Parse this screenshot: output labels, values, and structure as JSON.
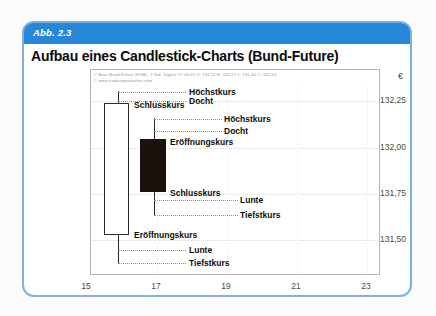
{
  "figure": {
    "label": "Abb. 2.3",
    "title": "Aufbau eines Candlestick-Charts (Bund-Future)"
  },
  "fine_print": {
    "line1": "© Euro-Bund-Future (FGBL, 1 Std. Tages) 17.06.05  O: 131,52  H: 132,27  L: 131,44  C: 132,24",
    "line2": "© www.tradesignalonline.com"
  },
  "axes": {
    "currency": "€",
    "y_labels": [
      "132,25",
      "132,00",
      "131,75",
      "131,50"
    ],
    "x_labels": [
      "15",
      "17",
      "19",
      "21",
      "23"
    ]
  },
  "annotations": {
    "candle1": {
      "high": "Höchstkurs",
      "upper_wick": "Docht",
      "close": "Schlusskurs",
      "open": "Eröffnungskurs",
      "lower_wick": "Lunte",
      "low": "Tiefstkurs"
    },
    "candle2": {
      "high": "Höchstkurs",
      "upper_wick": "Docht",
      "open": "Eröffnungskurs",
      "close": "Schlusskurs",
      "lower_wick": "Lunte",
      "low": "Tiefstkurs"
    }
  },
  "colors": {
    "header_blue": "#2787d9",
    "card_border": "#7db1e2",
    "candle_black_body": "#1c120d",
    "candle_white_body": "#ffffff"
  },
  "chart_data": {
    "type": "candlestick",
    "title": "Aufbau eines Candlestick-Charts (Bund-Future)",
    "ylabel": "€",
    "x_ticks": [
      15,
      17,
      19,
      21,
      23
    ],
    "y_ticks": [
      132.25,
      132.0,
      131.75,
      131.5
    ],
    "ylim": [
      131.35,
      132.42
    ],
    "xlim": [
      14.9,
      23.4
    ],
    "grid": true,
    "legend": false,
    "series": [
      {
        "name": "bullish-white-candle",
        "x": 16,
        "open": 131.53,
        "high": 132.3,
        "low": 131.37,
        "close": 132.24,
        "body": "white"
      },
      {
        "name": "bearish-black-candle",
        "x": 17,
        "open": 132.04,
        "high": 132.16,
        "low": 131.63,
        "close": 131.76,
        "body": "black"
      }
    ]
  }
}
